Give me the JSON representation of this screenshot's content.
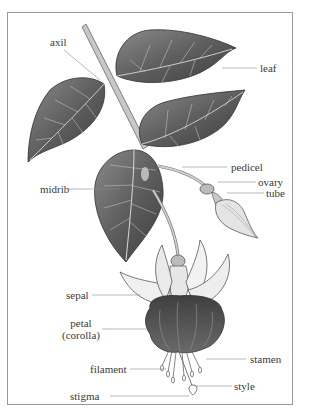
{
  "diagram": {
    "labels": {
      "axil": "axil",
      "leaf": "leaf",
      "pedicel": "pedicel",
      "ovary": "ovary",
      "midrib": "midrib",
      "tube": "tube",
      "sepal": "sepal",
      "petal_line1": "petal",
      "petal_line2": "(corolla)",
      "stamen": "stamen",
      "filament": "filament",
      "style": "style",
      "stigma": "stigma"
    },
    "colors": {
      "frame": "#9a9a9a",
      "leader": "#8a8a8a",
      "leaf_fill": "#6e6e6e",
      "leaf_dark": "#444444",
      "vein": "#d8d8d8",
      "stem": "#c4c4c4",
      "sepal": "#eeeeee",
      "corolla": "#555555",
      "text": "#3a3a3a"
    }
  }
}
